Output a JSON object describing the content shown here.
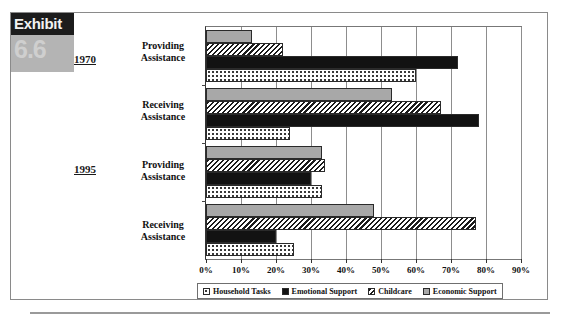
{
  "exhibit": {
    "word": "Exhibit",
    "number": "6.6"
  },
  "years": [
    {
      "label": "1970"
    },
    {
      "label": "1995"
    }
  ],
  "legend": {
    "items": [
      {
        "label": "Household Tasks",
        "key": "household",
        "swatch": "household-swatch"
      },
      {
        "label": "Emotional Support",
        "key": "emotional",
        "swatch": "emotional-swatch"
      },
      {
        "label": "Childcare",
        "key": "childcare",
        "swatch": "childcare-swatch"
      },
      {
        "label": "Economic Support",
        "key": "economic",
        "swatch": "economic-swatch"
      }
    ]
  },
  "axis": {
    "ticks": [
      "0%",
      "10%",
      "20%",
      "30%",
      "40%",
      "50%",
      "60%",
      "70%",
      "80%",
      "90%"
    ]
  },
  "categories": [
    {
      "line1": "Providing",
      "line2": "Assistance"
    },
    {
      "line1": "Receiving",
      "line2": "Assistance"
    },
    {
      "line1": "Providing",
      "line2": "Assistance"
    },
    {
      "line1": "Receiving",
      "line2": "Assistance"
    }
  ],
  "chart_data": {
    "type": "bar",
    "orientation": "horizontal",
    "title": "",
    "xlabel": "",
    "ylabel": "",
    "xlim": [
      0,
      90
    ],
    "grid": true,
    "legend_position": "bottom",
    "categories": [
      "1970 Providing Assistance",
      "1970 Receiving Assistance",
      "1995 Providing Assistance",
      "1995 Receiving Assistance"
    ],
    "series": [
      {
        "name": "Household Tasks",
        "values": [
          60,
          24,
          33,
          25
        ]
      },
      {
        "name": "Emotional Support",
        "values": [
          72,
          78,
          30,
          20
        ]
      },
      {
        "name": "Childcare",
        "values": [
          22,
          67,
          34,
          77
        ]
      },
      {
        "name": "Economic Support",
        "values": [
          13,
          53,
          33,
          48
        ]
      }
    ]
  }
}
